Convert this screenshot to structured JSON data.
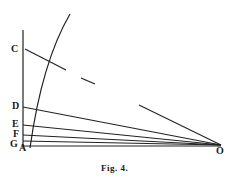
{
  "figure": {
    "caption": "Fig. 4.",
    "labels": {
      "C": "C",
      "D": "D",
      "E": "E",
      "F": "F",
      "G": "G",
      "A": "A",
      "O": "O"
    },
    "stroke_color": "#222222"
  }
}
